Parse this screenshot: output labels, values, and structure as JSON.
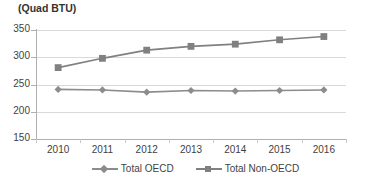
{
  "chart_data": {
    "type": "line",
    "title": "(Quad BTU)",
    "xlabel": "",
    "ylabel": "",
    "categories": [
      "2010",
      "2011",
      "2012",
      "2013",
      "2014",
      "2015",
      "2016"
    ],
    "series": [
      {
        "name": "Total OECD",
        "marker": "diamond",
        "color": "#8c8c8c",
        "values": [
          241,
          240,
          236,
          239,
          238,
          239,
          240
        ]
      },
      {
        "name": "Total Non-OECD",
        "marker": "square",
        "color": "#808080",
        "values": [
          281,
          298,
          313,
          320,
          324,
          332,
          338
        ]
      }
    ],
    "ylim": [
      150,
      350
    ],
    "yticks": [
      150,
      200,
      250,
      300,
      350
    ],
    "ytick_labels": [
      "150",
      "200",
      "250",
      "300",
      "350"
    ],
    "grid": true,
    "legend_position": "bottom"
  },
  "colors": {
    "grid": "#d9d9d9",
    "axis": "#b0b0b0",
    "text": "#3f3f3f",
    "series_oecd": "#8c8c8c",
    "series_non_oecd": "#808080",
    "background": "#ffffff"
  }
}
